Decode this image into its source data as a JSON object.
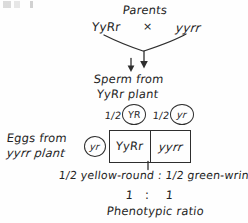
{
  "diagram": {
    "title": "Parents",
    "kind": "punnett-square-testcross",
    "ink_color": "#2e2e2e",
    "background_color": "#fefefe"
  },
  "parents": {
    "label": "Parents",
    "mother_genotype": "YyRr",
    "cross_symbol": "×",
    "father_genotype": "yyrr"
  },
  "sperm": {
    "line1": "Sperm from",
    "line2": "YyRr plant",
    "gametes": [
      {
        "fraction": "1/2",
        "allele": "YR"
      },
      {
        "fraction": "1/2",
        "allele": "yr"
      }
    ]
  },
  "eggs": {
    "line1": "Eggs from",
    "line2": "yyrr plant",
    "gametes": [
      {
        "allele": "yr"
      }
    ]
  },
  "punnett": {
    "cells": [
      "YyRr",
      "yyrr"
    ]
  },
  "results": {
    "phenotype_ratio_text": "1/2 yellow-round : 1/2 green-wrinkled",
    "ratio_left": "1",
    "ratio_colon": ":",
    "ratio_right": "1",
    "ratio_caption": "Phenotypic ratio"
  }
}
